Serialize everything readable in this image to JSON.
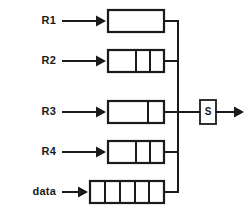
{
  "diagram": {
    "colors": {
      "line": "#1a1a1a",
      "background": "#ffffff",
      "fill": "#ffffff"
    },
    "registers": [
      {
        "label": "R1",
        "cells": 1,
        "width_class": "narrow",
        "arrow_label": "input-arrow-r1",
        "label_x": 37,
        "label_y": 14,
        "arrow_y": 21,
        "box_x": 108,
        "box_y": 10,
        "box_w": 56,
        "box_h": 22,
        "dividers": [],
        "stub_y": 21
      },
      {
        "label": "R2",
        "cells": 3,
        "width_class": "narrow",
        "arrow_label": "input-arrow-r2",
        "label_x": 37,
        "label_y": 53,
        "arrow_y": 60,
        "box_x": 108,
        "box_y": 50,
        "box_w": 56,
        "box_h": 22,
        "dividers": [
          136,
          150
        ],
        "stub_y": 61
      },
      {
        "label": "R3",
        "cells": 2,
        "width_class": "narrow",
        "arrow_label": "input-arrow-r3",
        "label_x": 37,
        "label_y": 104,
        "arrow_y": 111,
        "box_x": 108,
        "box_y": 92,
        "box_w": 56,
        "box_h": 22,
        "dividers": [
          148
        ],
        "stub_y": 112
      },
      {
        "label": "R4",
        "cells": 3,
        "width_class": "narrow",
        "arrow_label": "input-arrow-r4",
        "label_x": 37,
        "label_y": 145,
        "arrow_y": 152,
        "box_x": 108,
        "box_y": 141,
        "box_w": 56,
        "box_h": 22,
        "dividers": [
          136,
          150
        ],
        "stub_y": 152
      },
      {
        "label": "data",
        "cells": 5,
        "width_class": "wide",
        "arrow_label": "input-arrow-data",
        "label_x": 20,
        "label_y": 185,
        "arrow_y": 192,
        "box_x": 90,
        "box_y": 181,
        "box_w": 74,
        "box_h": 22,
        "dividers": [
          105,
          120,
          135,
          149
        ],
        "stub_y": 192
      }
    ],
    "bus": {
      "name": "vertical-bus",
      "x": 178,
      "y_top": 21,
      "y_bottom": 192
    },
    "selector": {
      "label": "S",
      "box_x": 200,
      "box_y": 100,
      "box_w": 16,
      "box_h": 24,
      "input_wire_from_x": 178,
      "input_wire_y": 112
    },
    "output": {
      "name": "output-arrow",
      "from_x": 216,
      "to_x": 244,
      "y": 112
    }
  }
}
